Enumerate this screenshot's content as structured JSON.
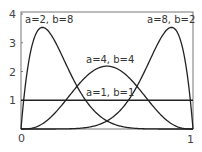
{
  "chart_data": {
    "type": "line",
    "title": "",
    "xlabel": "",
    "ylabel": "",
    "xlim": [
      0,
      1
    ],
    "ylim": [
      0,
      4
    ],
    "grid": false,
    "legend": "none (inline curve labels)",
    "x_ticks": [
      "0",
      "1"
    ],
    "y_ticks": [
      "1",
      "2",
      "3",
      "4"
    ],
    "series": [
      {
        "name": "a=2, b=8",
        "a": 2,
        "b": 8,
        "label": "a=2, b=8",
        "peak_x": 0.125,
        "peak_y": 3.52
      },
      {
        "name": "a=4, b=4",
        "a": 4,
        "b": 4,
        "label": "a=4, b=4",
        "peak_x": 0.5,
        "peak_y": 2.19
      },
      {
        "name": "a=8, b=2",
        "a": 8,
        "b": 2,
        "label": "a=8, b=2",
        "peak_x": 0.875,
        "peak_y": 3.52
      },
      {
        "name": "a=1, b=1",
        "a": 1,
        "b": 1,
        "label": "a=1, b=1",
        "peak_x": 0.5,
        "peak_y": 1.0
      }
    ],
    "colors": {
      "line": "#222222",
      "axis": "#555555",
      "text": "#333333"
    }
  }
}
